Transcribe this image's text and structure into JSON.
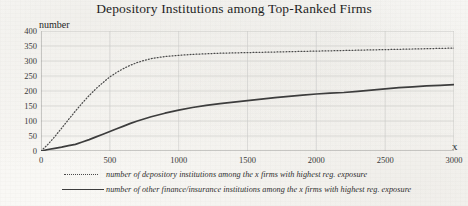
{
  "chart_data": {
    "type": "line",
    "title": "Depository Institutions among Top-Ranked Firms",
    "xlabel": "x",
    "ylabel": "number",
    "xlim": [
      0,
      3000
    ],
    "ylim": [
      0,
      400
    ],
    "grid": true,
    "legend_position": "below",
    "xticks": [
      "0",
      "500",
      "1000",
      "1500",
      "2000",
      "2500",
      "3000"
    ],
    "yticks": [
      "0",
      "50",
      "100",
      "150",
      "200",
      "250",
      "300",
      "350",
      "400"
    ],
    "series": [
      {
        "name": "number of depository institutions among the x firms with highest reg. exposure",
        "style": "dotted",
        "color": "#4a4a4a",
        "x": [
          0,
          50,
          100,
          150,
          200,
          250,
          300,
          350,
          400,
          450,
          500,
          550,
          600,
          650,
          700,
          750,
          800,
          900,
          1000,
          1100,
          1200,
          1300,
          1400,
          1500,
          1600,
          1700,
          1800,
          1900,
          2000,
          2100,
          2200,
          2300,
          2400,
          2500,
          2600,
          2700,
          2800,
          2900,
          3000
        ],
        "y": [
          0,
          22,
          48,
          76,
          105,
          133,
          160,
          185,
          208,
          228,
          247,
          262,
          275,
          286,
          295,
          302,
          308,
          315,
          319,
          322,
          324,
          326,
          327,
          328,
          329,
          330,
          331,
          332,
          333,
          334,
          335,
          336,
          337,
          338,
          339,
          340,
          341,
          342,
          343
        ]
      },
      {
        "name": "number of other finance/insurance institutions among the x firms with highest reg. exposure",
        "style": "solid",
        "color": "#3d3d3d",
        "x": [
          0,
          50,
          100,
          150,
          200,
          250,
          300,
          350,
          400,
          450,
          500,
          550,
          600,
          650,
          700,
          800,
          900,
          1000,
          1100,
          1200,
          1300,
          1400,
          1500,
          1600,
          1700,
          1800,
          1900,
          2000,
          2100,
          2200,
          2300,
          2400,
          2500,
          2600,
          2700,
          2800,
          2900,
          3000
        ],
        "y": [
          0,
          5,
          9,
          13,
          18,
          22,
          30,
          38,
          47,
          56,
          65,
          74,
          83,
          92,
          100,
          114,
          126,
          136,
          145,
          152,
          158,
          163,
          168,
          173,
          178,
          182,
          186,
          190,
          193,
          195,
          199,
          203,
          207,
          211,
          214,
          217,
          219,
          221
        ]
      }
    ]
  },
  "legend": [
    {
      "key": "dotted",
      "label": "number of depository institutions among the x firms with highest reg. exposure"
    },
    {
      "key": "solid",
      "label": "number of other finance/insurance institutions among the x firms with highest reg. exposure"
    }
  ]
}
